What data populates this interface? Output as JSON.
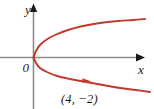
{
  "figure": {
    "kind": "math-graph",
    "background_color": "#ffffff",
    "width": 154,
    "height": 109
  },
  "axes": {
    "color": "#8c8c8c",
    "arrow_color": "#1a1a1a",
    "origin_label": "0",
    "x_axis_label": "x",
    "y_axis_label": "y",
    "x_axis_y_pixel": 57.5,
    "y_axis_x_pixel": 33.5
  },
  "annotations": {
    "point_label": "(4, −2)"
  },
  "chart_data": {
    "type": "line",
    "title": "",
    "xlabel": "x",
    "ylabel": "y",
    "grid": false,
    "legend": null,
    "curve_color": "#c0392b",
    "annotations": [
      {
        "text": "(4, −2)",
        "x": 4,
        "y": -2,
        "kind": "point-label"
      }
    ],
    "direction_arrow": {
      "on_branch": "lower",
      "pixel_x": 87,
      "pixel_y": 80,
      "points": "right-down"
    },
    "series": [
      {
        "name": "upper branch",
        "points_pixel": [
          [
            33.5,
            57.5
          ],
          [
            36,
            51
          ],
          [
            40,
            45
          ],
          [
            46,
            40
          ],
          [
            55,
            35
          ],
          [
            68,
            30
          ],
          [
            83,
            26
          ],
          [
            100,
            23
          ],
          [
            118,
            21
          ],
          [
            133,
            20
          ],
          [
            145,
            19
          ]
        ]
      },
      {
        "name": "lower branch",
        "points_pixel": [
          [
            33.5,
            57.5
          ],
          [
            36,
            63
          ],
          [
            40,
            68
          ],
          [
            47,
            72
          ],
          [
            57,
            76
          ],
          [
            70,
            79
          ],
          [
            86,
            82
          ],
          [
            103,
            85
          ],
          [
            120,
            88
          ],
          [
            136,
            90
          ],
          [
            150,
            92
          ]
        ]
      }
    ],
    "axis_extent_pixel": {
      "x_from": 0,
      "x_to": 143,
      "y_from": 6,
      "y_to": 109
    }
  }
}
